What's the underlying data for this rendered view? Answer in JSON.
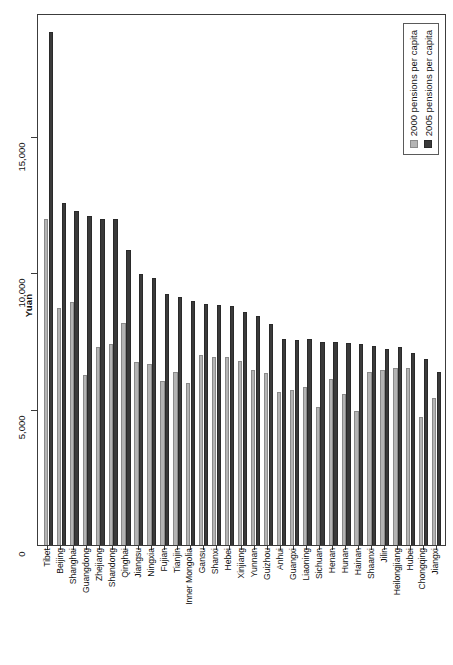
{
  "chart_data": {
    "type": "bar",
    "title": "",
    "xlabel": "",
    "ylabel": "Yuan",
    "ylim": [
      0,
      19500
    ],
    "grid": false,
    "legend_position": "top-right",
    "y_ticks": [
      "0",
      "5,000",
      "10,000",
      "15,000"
    ],
    "y_tick_values": [
      0,
      5000,
      10000,
      15000
    ],
    "categories": [
      "Tibet",
      "Beijing",
      "Shanghai",
      "Guangdong",
      "Zhejiang",
      "Shandong",
      "Qinghai",
      "Jiangsu",
      "Ningxia",
      "Fujian",
      "Tianjin",
      "Inner Mongolia",
      "Gansu",
      "Shanxi",
      "Hebei",
      "Xinjiang",
      "Yunnan",
      "Guizhou",
      "Anhui",
      "Guangxi",
      "Liaoning",
      "Sichuan",
      "Henan",
      "Hunan",
      "Hainan",
      "Shaanxi",
      "Jilin",
      "Heilongjiang",
      "Hubei",
      "Chongqing",
      "Jiangxi"
    ],
    "series": [
      {
        "name": "2000 pensions per capita",
        "color": "#b4b4b4",
        "values": [
          11950,
          8700,
          8900,
          6250,
          7250,
          7350,
          8150,
          6700,
          6650,
          6000,
          6350,
          5950,
          6950,
          6900,
          6900,
          6750,
          6400,
          6300,
          5600,
          5700,
          5800,
          5050,
          6100,
          5550,
          4900,
          6350,
          6400,
          6500,
          6500,
          4700,
          5400
        ]
      },
      {
        "name": "2005 pensions per capita",
        "color": "#3a3a3a",
        "values": [
          18800,
          12550,
          12250,
          12050,
          11950,
          11950,
          10800,
          9950,
          9800,
          9200,
          9100,
          8950,
          8850,
          8800,
          8750,
          8550,
          8400,
          8100,
          7550,
          7500,
          7550,
          7450,
          7450,
          7400,
          7350,
          7300,
          7200,
          7250,
          7050,
          6800,
          6350
        ]
      }
    ]
  },
  "legend": {
    "entries": [
      {
        "label": "2000 pensions per capita",
        "swatch": "s2000"
      },
      {
        "label": "2005 pensions per capita",
        "swatch": "s2005"
      }
    ]
  },
  "axis": {
    "y_title": "Yuan"
  }
}
